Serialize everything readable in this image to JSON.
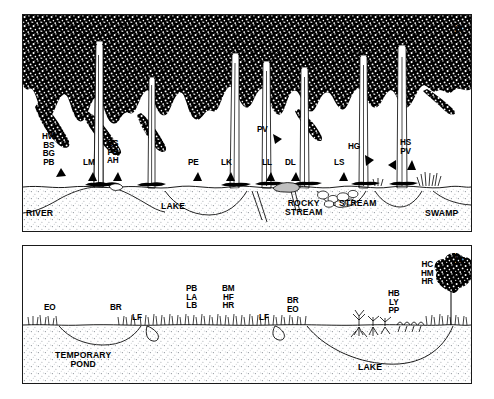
{
  "figure": {
    "panels": [
      {
        "letter": "a",
        "species_labels": [
          {
            "name": "label-hw-bs-bg-pb",
            "text": "HW\nBS\nBG\nPB",
            "x": 52,
            "y": 133
          },
          {
            "name": "label-lm",
            "text": "LM",
            "x": 89,
            "y": 163
          },
          {
            "name": "label-bs-pe-ah",
            "text": "BS\nPE\nAH",
            "x": 113,
            "y": 142
          },
          {
            "name": "label-pe",
            "text": "PE",
            "x": 193,
            "y": 163
          },
          {
            "name": "label-lk",
            "text": "LK",
            "x": 226,
            "y": 163
          },
          {
            "name": "label-pv",
            "text": "PV",
            "x": 260,
            "y": 127
          },
          {
            "name": "label-ll",
            "text": "LL",
            "x": 266,
            "y": 163
          },
          {
            "name": "label-dl",
            "text": "DL",
            "x": 291,
            "y": 163
          },
          {
            "name": "label-ls",
            "text": "LS",
            "x": 339,
            "y": 163
          },
          {
            "name": "label-hg",
            "text": "HG",
            "x": 352,
            "y": 144
          },
          {
            "name": "label-hs-pv",
            "text": "HS\nPV",
            "x": 404,
            "y": 141
          }
        ],
        "habitat_labels": [
          {
            "name": "habitat-river",
            "text": "RIVER",
            "x": 24,
            "y": 210
          },
          {
            "name": "habitat-lake",
            "text": "LAKE",
            "x": 162,
            "y": 204
          },
          {
            "name": "habitat-rocky-stream",
            "text": "ROCKY\nSTREAM",
            "x": 288,
            "y": 202
          },
          {
            "name": "habitat-stream",
            "text": "STREAM",
            "x": 341,
            "y": 202
          },
          {
            "name": "habitat-swamp",
            "text": "SWAMP",
            "x": 430,
            "y": 210
          }
        ]
      },
      {
        "letter": "b",
        "species_labels": [
          {
            "name": "label-eo",
            "text": "EO",
            "x": 48,
            "y": 307
          },
          {
            "name": "label-br",
            "text": "BR",
            "x": 114,
            "y": 307
          },
          {
            "name": "label-lf-left",
            "text": "LF",
            "x": 135,
            "y": 316
          },
          {
            "name": "label-pb-la-lb",
            "text": "PB\nLA\nLB",
            "x": 190,
            "y": 287
          },
          {
            "name": "label-bm-hf-hr",
            "text": "BM\nHF\nHR",
            "x": 226,
            "y": 287
          },
          {
            "name": "label-lf-right",
            "text": "LF",
            "x": 263,
            "y": 316
          },
          {
            "name": "label-br-eo",
            "text": "BR\nEO",
            "x": 291,
            "y": 300
          },
          {
            "name": "label-hb-ly-pp",
            "text": "HB\nLY\nPP",
            "x": 392,
            "y": 292
          },
          {
            "name": "label-hc-hm-hr",
            "text": "HC\nHM\nHR",
            "x": 425,
            "y": 263
          }
        ],
        "habitat_labels": [
          {
            "name": "habitat-temporary-pond",
            "text": "TEMPORARY\nPOND",
            "x": 85,
            "y": 352
          },
          {
            "name": "habitat-lake-b",
            "text": "LAKE",
            "x": 372,
            "y": 364
          }
        ]
      }
    ],
    "colors": {
      "ink": "#000000",
      "frame": "#1a1a1a",
      "canopy": "#000000",
      "soil_stipple": "#9aa0a6",
      "background": "#ffffff"
    }
  }
}
